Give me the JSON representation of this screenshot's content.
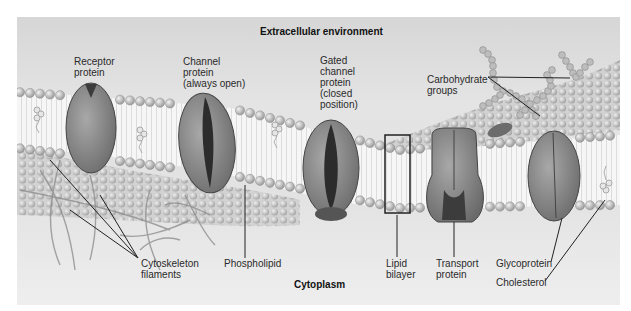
{
  "figure": {
    "title_top": "Extracellular environment",
    "title_bottom": "Cytoplasm"
  },
  "labels": {
    "receptor_protein": "Receptor\nprotein",
    "channel_protein": "Channel\nprotein\n(always open)",
    "gated_channel_protein": "Gated\nchannel\nprotein\n(closed\nposition)",
    "carbohydrate_groups": "Carbohydrate\ngroups",
    "cytoskeleton_filaments": "Cytoskeleton\nfilaments",
    "phospholipid": "Phospholipid",
    "lipid_bilayer": "Lipid\nbilayer",
    "transport_protein": "Transport\nprotein",
    "glycoprotein": "Glycoprotein",
    "cholesterol": "Cholesterol"
  },
  "colors": {
    "background": "#ffffff",
    "panel": "#e2e2e2",
    "protein_fill": "#8c8c8c",
    "protein_dark": "#3c3c3c",
    "head_group": "#c4c4c4",
    "tails": "#f4f4f4",
    "leader_line": "#222222"
  }
}
